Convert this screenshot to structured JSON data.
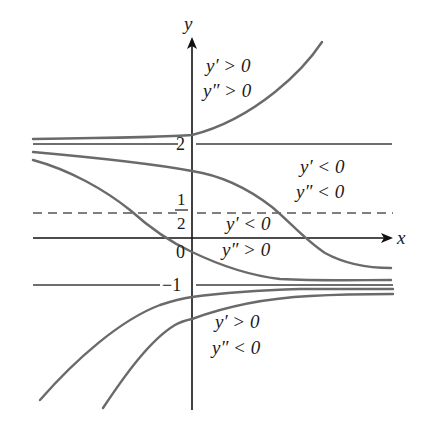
{
  "diagram": {
    "type": "direction-field-solution-curves",
    "axes": {
      "x_label": "x",
      "y_label": "y",
      "origin_label": "0"
    },
    "horizontal_lines": [
      {
        "value": "2",
        "label": "2",
        "style": "solid",
        "role": "equilibrium"
      },
      {
        "value": "1/2",
        "label_num": "1",
        "label_den": "2",
        "style": "dashed",
        "role": "inflection-level"
      },
      {
        "value": "-1",
        "label": "−1",
        "style": "solid",
        "role": "equilibrium"
      }
    ],
    "regions": [
      {
        "id": "above-2",
        "line1": "y′ > 0",
        "line2": "y″ > 0"
      },
      {
        "id": "between-half-and-2",
        "line1": "y′ < 0",
        "line2": "y″ < 0"
      },
      {
        "id": "between-minus1-and-half",
        "line1": "y′ < 0",
        "line2": "y″ > 0"
      },
      {
        "id": "below-minus1",
        "line1": "y′ > 0",
        "line2": "y″ < 0"
      }
    ],
    "curves": [
      {
        "id": "curve-above-2",
        "description": "increasing, concave up, approaches y=2 as x→−∞"
      },
      {
        "id": "curve-s-right",
        "description": "decreasing from near 2 to near −1, inflection at y=1/2"
      },
      {
        "id": "curve-s-left",
        "description": "decreasing from near 2 to near −1, inflection at y=1/2"
      },
      {
        "id": "curve-below-1",
        "description": "increasing, concave down, approaches y=−1 as x→∞"
      },
      {
        "id": "curve-below-2",
        "description": "increasing, concave down, approaches y=−1 as x→∞"
      }
    ],
    "colors": {
      "curves": "#6a6a6a",
      "axes": "#111111",
      "text": "#1a1a1a",
      "background": "#ffffff"
    }
  }
}
